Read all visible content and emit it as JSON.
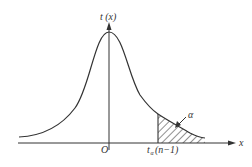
{
  "diagram": {
    "type": "t-distribution upper tail diagram",
    "y_axis_label": "t (x)",
    "x_axis_label": "x",
    "origin_label": "O",
    "critical_value_label": "t",
    "critical_value_subscript": "α",
    "critical_value_args": "(n−1)",
    "tail_area_label": "α",
    "colors": {
      "stroke": "#333333",
      "background": "#ffffff"
    }
  }
}
